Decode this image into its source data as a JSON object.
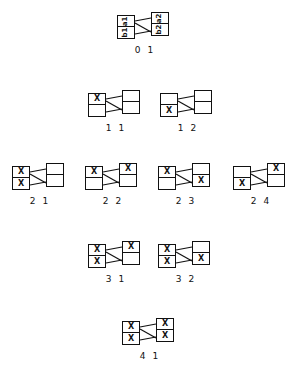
{
  "diagram": {
    "canvas": {
      "width": 291,
      "height": 372,
      "background": "#ffffff"
    },
    "ink_color": "#111111",
    "figures": [
      {
        "id": "fig-01",
        "caption": "0 1",
        "x": 117,
        "y": 12,
        "rotated_labels": true,
        "cells": {
          "left_top": "a1",
          "left_bottom": "b1",
          "right_top": "a2",
          "right_bottom": "b2"
        },
        "edges": [
          "top-top",
          "diagonal",
          "bottom-bottom"
        ]
      },
      {
        "id": "fig-11",
        "caption": "1 1",
        "x": 88,
        "y": 90,
        "rotated_labels": false,
        "cells": {
          "left_top": "X",
          "left_bottom": "",
          "right_top": "",
          "right_bottom": ""
        },
        "edges": [
          "top-top",
          "diagonal",
          "bottom-bottom"
        ]
      },
      {
        "id": "fig-12",
        "caption": "1 2",
        "x": 160,
        "y": 90,
        "rotated_labels": false,
        "cells": {
          "left_top": "",
          "left_bottom": "X",
          "right_top": "",
          "right_bottom": ""
        },
        "edges": [
          "top-top",
          "diagonal",
          "bottom-bottom"
        ]
      },
      {
        "id": "fig-21",
        "caption": "2 1",
        "x": 12,
        "y": 163,
        "rotated_labels": false,
        "cells": {
          "left_top": "X",
          "left_bottom": "X",
          "right_top": "",
          "right_bottom": ""
        },
        "edges": [
          "top-top",
          "diagonal",
          "bottom-bottom"
        ]
      },
      {
        "id": "fig-22",
        "caption": "2 2",
        "x": 85,
        "y": 163,
        "rotated_labels": false,
        "cells": {
          "left_top": "X",
          "left_bottom": "",
          "right_top": "X",
          "right_bottom": ""
        },
        "edges": [
          "top-top",
          "diagonal",
          "bottom-bottom"
        ]
      },
      {
        "id": "fig-23",
        "caption": "2 3",
        "x": 158,
        "y": 163,
        "rotated_labels": false,
        "cells": {
          "left_top": "X",
          "left_bottom": "",
          "right_top": "",
          "right_bottom": "X"
        },
        "edges": [
          "top-top",
          "diagonal",
          "bottom-bottom"
        ]
      },
      {
        "id": "fig-24",
        "caption": "2 4",
        "x": 233,
        "y": 163,
        "rotated_labels": false,
        "cells": {
          "left_top": "",
          "left_bottom": "X",
          "right_top": "X",
          "right_bottom": ""
        },
        "edges": [
          "top-top",
          "diagonal",
          "bottom-bottom"
        ]
      },
      {
        "id": "fig-31",
        "caption": "3 1",
        "x": 88,
        "y": 241,
        "rotated_labels": false,
        "cells": {
          "left_top": "X",
          "left_bottom": "X",
          "right_top": "X",
          "right_bottom": ""
        },
        "edges": [
          "top-top",
          "diagonal",
          "bottom-bottom"
        ]
      },
      {
        "id": "fig-32",
        "caption": "3 2",
        "x": 158,
        "y": 241,
        "rotated_labels": false,
        "cells": {
          "left_top": "X",
          "left_bottom": "X",
          "right_top": "",
          "right_bottom": "X"
        },
        "edges": [
          "top-top",
          "diagonal",
          "bottom-bottom"
        ]
      },
      {
        "id": "fig-41",
        "caption": "4 1",
        "x": 122,
        "y": 318,
        "rotated_labels": false,
        "cells": {
          "left_top": "X",
          "left_bottom": "X",
          "right_top": "X",
          "right_bottom": "X"
        },
        "edges": [
          "top-top",
          "diagonal",
          "bottom-bottom"
        ]
      }
    ]
  }
}
